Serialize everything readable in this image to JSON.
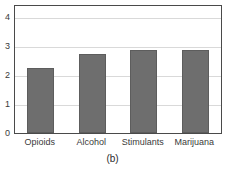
{
  "chart_data": {
    "type": "bar",
    "title": "",
    "subtitle": "",
    "caption": "(b)",
    "xlabel": "",
    "ylabel": "",
    "categories": [
      "Opioids",
      "Alcohol",
      "Stimulants",
      "Marijuana"
    ],
    "values": [
      2.25,
      2.7,
      2.85,
      2.85
    ],
    "series": [
      {
        "name": "",
        "values": [
          2.25,
          2.7,
          2.85,
          2.85
        ]
      }
    ],
    "ylim": [
      0,
      4.4
    ],
    "yticks": [
      0,
      1,
      2,
      3,
      4
    ],
    "ytick_labels": [
      "0",
      "1",
      "2",
      "3",
      "4"
    ],
    "grid": true,
    "grid_axis": "y",
    "legend": false,
    "legend_position": "none",
    "bar_color": "#6e6e6e",
    "grid_color": "#d9d9d9",
    "frame_color": "#4a4a4a",
    "background_color": "#ffffff"
  }
}
